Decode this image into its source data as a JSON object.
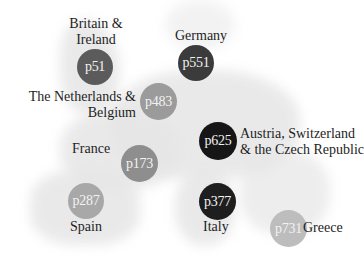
{
  "map": {
    "regions": [
      {
        "id": "britain-ireland",
        "label": "Britain & Ireland",
        "label_lines": [
          "Britain &",
          "Ireland"
        ],
        "page": "p51",
        "color": "#5b5b5b"
      },
      {
        "id": "netherlands-belgium",
        "label": "The Netherlands & Belgium",
        "label_lines": [
          "The Netherlands &",
          "Belgium"
        ],
        "page": "p483",
        "color": "#9b9b9b"
      },
      {
        "id": "germany",
        "label": "Germany",
        "label_lines": [
          "Germany"
        ],
        "page": "p551",
        "color": "#3b3b3b"
      },
      {
        "id": "austria-switzerland-czech",
        "label": "Austria, Switzerland & the Czech Republic",
        "label_lines": [
          "Austria, Switzerland",
          "& the Czech Republic"
        ],
        "page": "p625",
        "color": "#161616"
      },
      {
        "id": "france",
        "label": "France",
        "label_lines": [
          "France"
        ],
        "page": "p173",
        "color": "#8e8e8e"
      },
      {
        "id": "spain",
        "label": "Spain",
        "label_lines": [
          "Spain"
        ],
        "page": "p287",
        "color": "#a8a8a8"
      },
      {
        "id": "italy",
        "label": "Italy",
        "label_lines": [
          "Italy"
        ],
        "page": "p377",
        "color": "#1e1e1e"
      },
      {
        "id": "greece",
        "label": "Greece",
        "label_lines": [
          "Greece"
        ],
        "page": "p731",
        "color": "#bdbdbd"
      }
    ]
  }
}
